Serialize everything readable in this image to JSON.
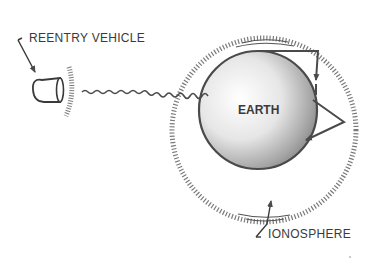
{
  "diagram": {
    "labels": {
      "reentry_vehicle": "REENTRY VEHICLE",
      "earth": "EARTH",
      "ionosphere": "IONOSPHERE"
    },
    "elements": [
      {
        "name": "reentry-vehicle",
        "description": "capsule shape with plasma sheath hatching"
      },
      {
        "name": "radio-wave",
        "description": "wavy signal line from vehicle to Earth"
      },
      {
        "name": "ionosphere-shell",
        "description": "hatched circle surrounding Earth"
      },
      {
        "name": "earth",
        "description": "shaded sphere"
      },
      {
        "name": "skip-path",
        "description": "arrowed path bouncing between ionosphere and Earth"
      }
    ],
    "colors": {
      "ink": "#4a4a4a",
      "hatch": "#7a7a7a",
      "background": "#ffffff"
    }
  }
}
